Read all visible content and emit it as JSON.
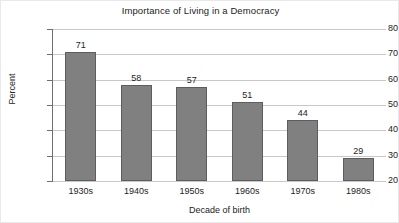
{
  "chart_data": {
    "type": "bar",
    "title": "Importance of Living in a Democracy",
    "xlabel": "Decade of birth",
    "ylabel": "Percent",
    "categories": [
      "1930s",
      "1940s",
      "1950s",
      "1960s",
      "1970s",
      "1980s"
    ],
    "values": [
      71,
      58,
      57,
      51,
      44,
      29
    ],
    "data_labels": [
      "71",
      "58",
      "57",
      "51",
      "44",
      "29"
    ],
    "ylim": [
      20,
      80
    ],
    "ytick_step": 10,
    "yticks": [
      80,
      70,
      60,
      50,
      40,
      30,
      20
    ],
    "ytick_labels": [
      "80",
      "70",
      "60",
      "50",
      "40",
      "30",
      "20"
    ],
    "grid": "horizontal",
    "legend": "none",
    "series": [
      {
        "name": "Percent",
        "values": [
          71,
          58,
          57,
          51,
          44,
          29
        ]
      }
    ],
    "colors": {
      "bar_fill": "#808080",
      "bar_border": "#5d5d5d",
      "gridline": "#c8c8c8",
      "axis": "#6e6e6e",
      "text": "#232323",
      "background": "#ffffff"
    }
  }
}
